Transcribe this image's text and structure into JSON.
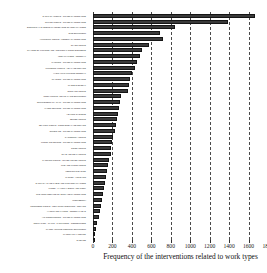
{
  "chart_data": {
    "type": "bar",
    "orientation": "horizontal",
    "title": "",
    "subtitle": "",
    "xlabel": "Frequency of the interventions related to work types",
    "ylabel": "",
    "xlim": [
      0,
      1800
    ],
    "xticks": [
      0,
      200,
      400,
      600,
      800,
      1000,
      1200,
      1400,
      1600,
      1800
    ],
    "xtick_labels": [
      "0",
      "200",
      "400",
      "600",
      "800",
      "1000",
      "1200",
      "1400",
      "1600",
      "1800"
    ],
    "grid": "vertical-dashed",
    "legend": "none",
    "bar_color": "#3a3a3a",
    "bar_edge_color": "#151515",
    "categories": [
      "SANITARY WORKS - OTHER MAINTENANCE",
      "OFFICE WORKS - OTHER MAINTENANCE",
      "ELECTRICAL SYSTEMS MAINTENANCE OF INSTALLATIONS",
      "SITE EQUIPMENT",
      "ALUMINIUM WORKS - JOINERY MAINTENANCE",
      "GLASS WORKS",
      "CHANGE OF FITTINGS AND ADDITIONAL ROOM ELEMENTS",
      "INSTALLATIONS - RENEWAL",
      "PAINTING - OTHER MAINTENANCE",
      "PLUMBING WORKS - LEAKAGE REPAIRS",
      "HYDRAULIC FITTINGS RENEWAL",
      "PLASTER - OTHER MAINTENANCE",
      "WASTE DISPOSAL",
      "STORAGE WORKS",
      "ROOF WORKS AND LEAKAGE EQUIPMENT",
      "SUPPLEMENTARY WALL - OTHER MAINTENANCE",
      "FALSE CEILINGS - OTHER MAINTENANCE",
      "HEATING SYSTEMS",
      "SEWER WORKS",
      "SEALING WORKS - DOOR BREAKAGE REPAIRS",
      "CUPBOARD - OTHER MAINTENANCE",
      "CARPENTRY WORKS",
      "FLOOR COVERINGS - OTHER MAINTENANCE",
      "DOOR WORKS",
      "SLAB AND SEAT WORKS",
      "PAINTING WORKS - OTHER COVER WORKS",
      "TILE AND FLOOR JOINTS",
      "FENCING CLEANING",
      "CARPET - FINISHING",
      "SANITARY WARE TABLE AND PIPE INSTALLATIONS",
      "FLOOR - LAYING LABOUR AND WORK",
      "CLEANING SERVICE OF SURFACE MAINTENANCE",
      "WORKBENCH",
      "CONCRETE WORKS - REPAIRING INJECTION - REPAIRS",
      "HARDWARE FIXINGS - RENEWAL KEYS",
      "AIR CONDITIONING - OTHER MAINTENANCE",
      "INSULATION - WALLS - PARTITIONS - CONNECTIONS",
      "WATER VOLUME CONTROL EQUIPMENT",
      "MATERIALS HANDLING",
      "SHELVES"
    ],
    "values": [
      1670,
      1390,
      845,
      690,
      720,
      580,
      505,
      480,
      455,
      430,
      405,
      385,
      370,
      355,
      290,
      275,
      265,
      255,
      245,
      235,
      225,
      210,
      200,
      190,
      180,
      165,
      150,
      140,
      130,
      120,
      110,
      100,
      92,
      80,
      70,
      58,
      45,
      32,
      20,
      10
    ]
  }
}
